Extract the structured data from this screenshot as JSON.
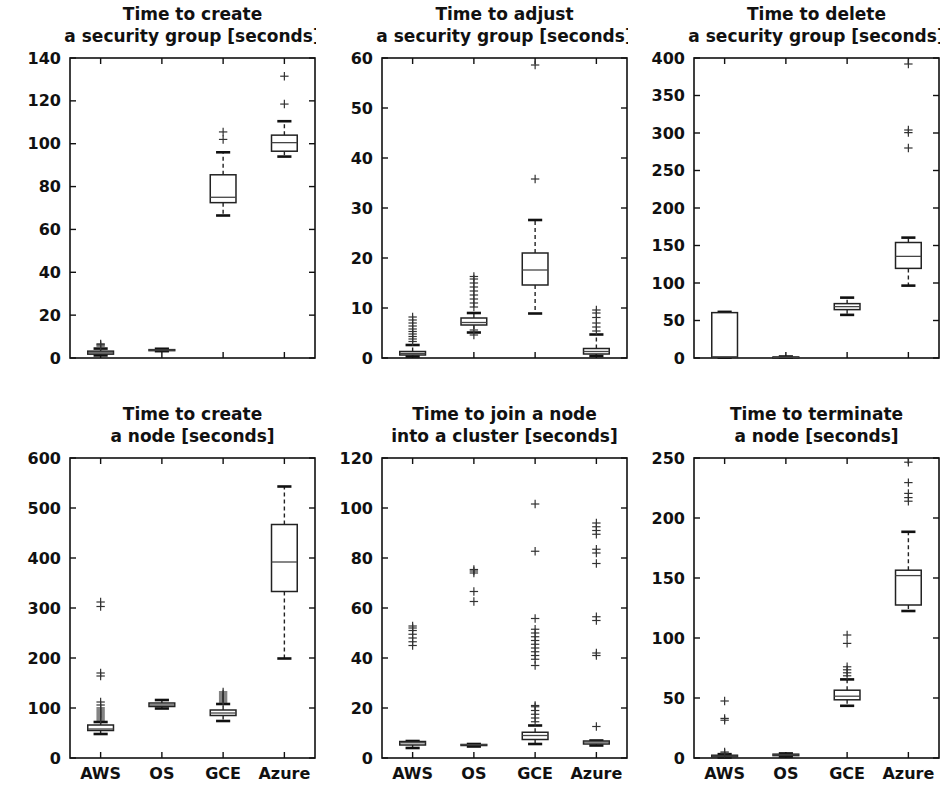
{
  "figure": {
    "width": 947,
    "height": 807,
    "background": "#ffffff",
    "ink": "#111111",
    "rows": 2,
    "cols": 3
  },
  "categories": [
    "AWS",
    "OS",
    "GCE",
    "Azure"
  ],
  "chart_data": [
    {
      "type": "box",
      "panel_index": 0,
      "title_line1": "Time to create",
      "title_line2": "a security group [seconds]",
      "title": "Time to create a security group [seconds]",
      "xlabel": "",
      "ylabel": "",
      "ylim": [
        0,
        140
      ],
      "yticks": [
        0,
        20,
        40,
        60,
        80,
        100,
        120,
        140
      ],
      "xticklabels_visible": false,
      "categories": [
        "AWS",
        "OS",
        "GCE",
        "Azure"
      ],
      "grid": false,
      "legend": "none",
      "boxes": [
        {
          "label": "AWS",
          "whislo": 1.2,
          "q1": 1.8,
          "med": 2.4,
          "q3": 3.2,
          "whishi": 4.4,
          "fliers": [
            5.6,
            6.2,
            6.6
          ]
        },
        {
          "label": "OS",
          "whislo": 3.2,
          "q1": 3.5,
          "med": 3.7,
          "q3": 3.9,
          "whishi": 4.3,
          "fliers": []
        },
        {
          "label": "GCE",
          "whislo": 66.5,
          "q1": 72.5,
          "med": 75.0,
          "q3": 85.5,
          "whishi": 96.0,
          "fliers": [
            102.0,
            105.5
          ]
        },
        {
          "label": "Azure",
          "whislo": 94.0,
          "q1": 96.5,
          "med": 100.5,
          "q3": 104.0,
          "whishi": 110.5,
          "fliers": [
            118.5,
            131.5
          ]
        }
      ]
    },
    {
      "type": "box",
      "panel_index": 1,
      "title_line1": "Time to adjust",
      "title_line2": "a security group [seconds]",
      "title": "Time to adjust a security group [seconds]",
      "xlabel": "",
      "ylabel": "",
      "ylim": [
        0,
        60
      ],
      "yticks": [
        0,
        10,
        20,
        30,
        40,
        50,
        60
      ],
      "xticklabels_visible": false,
      "categories": [
        "AWS",
        "OS",
        "GCE",
        "Azure"
      ],
      "grid": false,
      "legend": "none",
      "boxes": [
        {
          "label": "AWS",
          "whislo": 0.3,
          "q1": 0.6,
          "med": 0.9,
          "q3": 1.3,
          "whishi": 2.6,
          "fliers": [
            3.3,
            3.8,
            4.3,
            4.8,
            5.3,
            5.8,
            6.4,
            7.0,
            7.6,
            8.2
          ]
        },
        {
          "label": "OS",
          "whislo": 5.1,
          "q1": 6.6,
          "med": 7.1,
          "q3": 8.0,
          "whishi": 9.0,
          "fliers": [
            4.6,
            5.6,
            10.2,
            11.0,
            11.8,
            12.6,
            13.4,
            14.2,
            15.0,
            15.8,
            16.3
          ]
        },
        {
          "label": "GCE",
          "whislo": 8.9,
          "q1": 14.6,
          "med": 17.6,
          "q3": 21.0,
          "whishi": 27.6,
          "fliers": [
            35.8,
            58.6
          ]
        },
        {
          "label": "Azure",
          "whislo": 0.4,
          "q1": 0.8,
          "med": 1.3,
          "q3": 1.9,
          "whishi": 4.7,
          "fliers": [
            5.4,
            6.2,
            7.0,
            8.1,
            9.0,
            9.6
          ]
        }
      ]
    },
    {
      "type": "box",
      "panel_index": 2,
      "title_line1": "Time to delete",
      "title_line2": "a security group [seconds]",
      "title": "Time to delete a security group [seconds]",
      "xlabel": "",
      "ylabel": "",
      "ylim": [
        0,
        400
      ],
      "yticks": [
        0,
        50,
        100,
        150,
        200,
        250,
        300,
        350,
        400
      ],
      "xticklabels_visible": false,
      "categories": [
        "AWS",
        "OS",
        "GCE",
        "Azure"
      ],
      "grid": false,
      "legend": "none",
      "boxes": [
        {
          "label": "AWS",
          "whislo": 0.5,
          "q1": 1.0,
          "med": 1.5,
          "q3": 60.5,
          "whishi": 61.5,
          "fliers": []
        },
        {
          "label": "OS",
          "whislo": 0.4,
          "q1": 0.7,
          "med": 1.0,
          "q3": 1.4,
          "whishi": 2.0,
          "fliers": []
        },
        {
          "label": "GCE",
          "whislo": 57.5,
          "q1": 64.5,
          "med": 68.5,
          "q3": 72.5,
          "whishi": 80.5,
          "fliers": []
        },
        {
          "label": "Azure",
          "whislo": 96.5,
          "q1": 119.5,
          "med": 135.5,
          "q3": 154.0,
          "whishi": 160.5,
          "fliers": [
            280.0,
            300.5,
            304.0,
            392.0
          ]
        }
      ]
    },
    {
      "type": "box",
      "panel_index": 3,
      "title_line1": "Time to create",
      "title_line2": "a node [seconds]",
      "title": "Time to create a node [seconds]",
      "xlabel": "",
      "ylabel": "",
      "ylim": [
        0,
        600
      ],
      "yticks": [
        0,
        100,
        200,
        300,
        400,
        500,
        600
      ],
      "xticklabels_visible": true,
      "categories": [
        "AWS",
        "OS",
        "GCE",
        "Azure"
      ],
      "grid": false,
      "legend": "none",
      "boxes": [
        {
          "label": "AWS",
          "whislo": 48.0,
          "q1": 55.0,
          "med": 58.0,
          "q3": 66.0,
          "whishi": 72.0,
          "fliers": [
            76,
            80,
            84,
            88,
            92,
            96,
            100,
            106,
            112,
            164,
            170,
            303,
            312
          ]
        },
        {
          "label": "OS",
          "whislo": 99.0,
          "q1": 103.0,
          "med": 106.0,
          "q3": 110.0,
          "whishi": 116.0,
          "fliers": []
        },
        {
          "label": "GCE",
          "whislo": 74.0,
          "q1": 85.0,
          "med": 90.0,
          "q3": 96.0,
          "whishi": 108.0,
          "fliers": [
            112,
            116,
            120,
            124,
            128,
            132
          ]
        },
        {
          "label": "Azure",
          "whislo": 199.0,
          "q1": 333.0,
          "med": 392.0,
          "q3": 467.0,
          "whishi": 543.0,
          "fliers": []
        }
      ]
    },
    {
      "type": "box",
      "panel_index": 4,
      "title_line1": "Time to join a node",
      "title_line2": "into a cluster [seconds]",
      "title": "Time to join a node into a cluster [seconds]",
      "xlabel": "",
      "ylabel": "",
      "ylim": [
        0,
        120
      ],
      "yticks": [
        0,
        20,
        40,
        60,
        80,
        100,
        120
      ],
      "xticklabels_visible": true,
      "categories": [
        "AWS",
        "OS",
        "GCE",
        "Azure"
      ],
      "grid": false,
      "legend": "none",
      "boxes": [
        {
          "label": "AWS",
          "whislo": 4.0,
          "q1": 5.2,
          "med": 6.1,
          "q3": 6.6,
          "whishi": 6.8,
          "fliers": [
            45.0,
            46.5,
            48.0,
            49.5,
            51.0,
            52.0,
            52.8
          ]
        },
        {
          "label": "OS",
          "whislo": 4.6,
          "q1": 5.1,
          "med": 5.3,
          "q3": 5.4,
          "whishi": 5.6,
          "fliers": [
            62.6,
            66.6,
            74.0,
            74.8,
            75.4
          ]
        },
        {
          "label": "GCE",
          "whislo": 5.6,
          "q1": 7.4,
          "med": 9.0,
          "q3": 10.3,
          "whishi": 13.0,
          "fliers": [
            14.5,
            16.0,
            17.5,
            19.0,
            20.5,
            21.0,
            37.0,
            39.5,
            41.0,
            42.5,
            44.0,
            45.5,
            47.0,
            48.5,
            50.0,
            51.5,
            55.8,
            82.7,
            101.6
          ]
        },
        {
          "label": "Azure",
          "whislo": 5.0,
          "q1": 5.6,
          "med": 6.4,
          "q3": 6.8,
          "whishi": 7.0,
          "fliers": [
            12.6,
            41.0,
            42.0,
            55.0,
            56.5,
            77.8,
            82.0,
            83.5,
            89.5,
            91.0,
            92.5,
            94.0
          ]
        }
      ]
    },
    {
      "type": "box",
      "panel_index": 5,
      "title_line1": "Time to terminate",
      "title_line2": "a node [seconds]",
      "title": "Time to terminate a node [seconds]",
      "xlabel": "",
      "ylabel": "",
      "ylim": [
        0,
        250
      ],
      "yticks": [
        0,
        50,
        100,
        150,
        200,
        250
      ],
      "xticklabels_visible": true,
      "categories": [
        "AWS",
        "OS",
        "GCE",
        "Azure"
      ],
      "grid": false,
      "legend": "none",
      "boxes": [
        {
          "label": "AWS",
          "whislo": 0.5,
          "q1": 1.0,
          "med": 1.6,
          "q3": 2.3,
          "whishi": 3.2,
          "fliers": [
            4.0,
            5.0,
            31.5,
            33.0,
            47.5
          ]
        },
        {
          "label": "OS",
          "whislo": 1.2,
          "q1": 2.0,
          "med": 2.6,
          "q3": 3.2,
          "whishi": 3.8,
          "fliers": []
        },
        {
          "label": "GCE",
          "whislo": 43.5,
          "q1": 48.5,
          "med": 51.5,
          "q3": 56.5,
          "whishi": 65.5,
          "fliers": [
            68.5,
            71.0,
            73.5,
            76.0,
            95.5,
            102.5
          ]
        },
        {
          "label": "Azure",
          "whislo": 122.5,
          "q1": 127.5,
          "med": 152.0,
          "q3": 156.5,
          "whishi": 188.5,
          "fliers": [
            214.0,
            217.0,
            220.5,
            229.5,
            246.5
          ]
        }
      ]
    }
  ]
}
